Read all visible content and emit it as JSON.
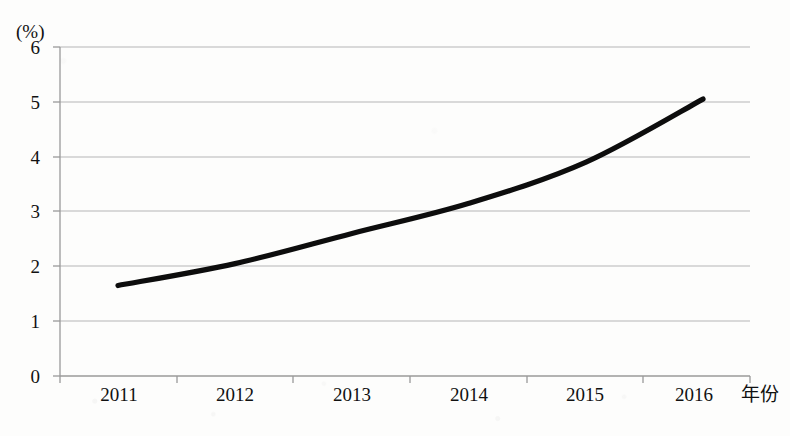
{
  "chart_data": {
    "type": "line",
    "title": "",
    "xlabel": "年份",
    "ylabel": "(%)",
    "categories": [
      "2011",
      "2012",
      "2013",
      "2014",
      "2015",
      "2016"
    ],
    "values": [
      1.65,
      2.05,
      2.6,
      3.15,
      3.9,
      5.05
    ],
    "series": [
      {
        "name": "",
        "values": [
          1.65,
          2.05,
          2.6,
          3.15,
          3.9,
          5.05
        ]
      }
    ],
    "ylim": [
      0,
      6
    ],
    "ytick_labels": [
      "0",
      "1",
      "2",
      "3",
      "4",
      "5",
      "6"
    ],
    "ytick_values": [
      0,
      1,
      2,
      3,
      4,
      5,
      6
    ],
    "xtick_labels": [
      "2011",
      "2012",
      "2013",
      "2014",
      "2015",
      "2016"
    ],
    "grid": true,
    "grid_axis": "y",
    "legend": false,
    "legend_position": "none",
    "line_color": "#0d0d0d",
    "grid_color": "#b5b5b5",
    "axis_color": "#9a9a9a",
    "background_color": "#fdfdfc"
  },
  "axis": {
    "unit_label": "(%)",
    "x_title": "年份"
  }
}
